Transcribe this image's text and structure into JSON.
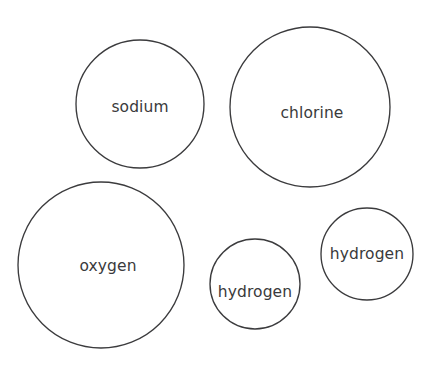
{
  "figure": {
    "title": "",
    "background_color": "#ffffff",
    "stroke_color": "#3b3b3d",
    "text_color": "#3a3a3c",
    "width": 431,
    "height": 370
  },
  "atoms": [
    {
      "label": "sodium",
      "name": "sodium",
      "cx": 140,
      "cy": 104,
      "r": 64,
      "text_x": 140,
      "text_y": 112,
      "font_size": 15.5
    },
    {
      "label": "chlorine",
      "name": "chlorine",
      "cx": 310,
      "cy": 107,
      "r": 80,
      "text_x": 312,
      "text_y": 118,
      "font_size": 15.5
    },
    {
      "label": "oxygen",
      "name": "oxygen",
      "cx": 101,
      "cy": 265,
      "r": 83,
      "text_x": 108,
      "text_y": 271,
      "font_size": 15.5
    },
    {
      "label": "hydrogen",
      "name": "hydrogen-lower",
      "cx": 255,
      "cy": 284,
      "r": 45,
      "text_x": 255,
      "text_y": 297,
      "font_size": 15.5
    },
    {
      "label": "hydrogen",
      "name": "hydrogen-right",
      "cx": 367,
      "cy": 254,
      "r": 46,
      "text_x": 367,
      "text_y": 259,
      "font_size": 15.5
    }
  ]
}
